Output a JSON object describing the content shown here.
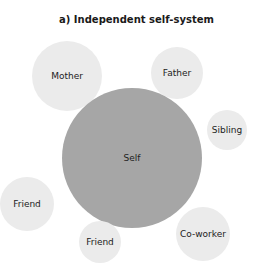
{
  "title": "a) Independent self-system",
  "nodes": [
    {
      "id": "self",
      "label": "Self",
      "cx": 132,
      "cy": 158,
      "r": 70,
      "shade": "#a6a6a6"
    },
    {
      "id": "mother",
      "label": "Mother",
      "cx": 67,
      "cy": 76,
      "r": 35,
      "shade": "#ebebeb"
    },
    {
      "id": "father",
      "label": "Father",
      "cx": 177,
      "cy": 73,
      "r": 26,
      "shade": "#ebebeb"
    },
    {
      "id": "sibling",
      "label": "Sibling",
      "cx": 227,
      "cy": 130,
      "r": 20,
      "shade": "#ebebeb"
    },
    {
      "id": "friend1",
      "label": "Friend",
      "cx": 27,
      "cy": 204,
      "r": 27,
      "shade": "#ebebeb"
    },
    {
      "id": "friend2",
      "label": "Friend",
      "cx": 100,
      "cy": 242,
      "r": 21,
      "shade": "#ebebeb"
    },
    {
      "id": "coworker",
      "label": "Co-worker",
      "cx": 203,
      "cy": 234,
      "r": 27,
      "shade": "#ebebeb"
    }
  ]
}
